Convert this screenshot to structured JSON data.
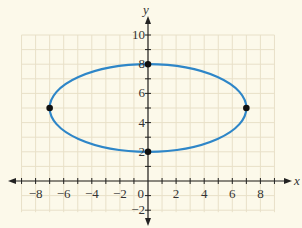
{
  "chart_data": {
    "type": "line",
    "title": "",
    "xlabel": "x",
    "ylabel": "y",
    "xlim": [
      -9,
      9
    ],
    "ylim": [
      -2.5,
      10.5
    ],
    "grid": true,
    "x_ticks": [
      -8,
      -6,
      -4,
      -2,
      0,
      2,
      4,
      6,
      8
    ],
    "x_tick_labels": [
      "−8",
      "−6",
      "−4",
      "−2",
      "0",
      "2",
      "4",
      "6",
      "8"
    ],
    "y_ticks": [
      -2,
      2,
      4,
      6,
      8,
      10
    ],
    "y_tick_labels": [
      "−2",
      "2",
      "4",
      "6",
      "8",
      "10"
    ],
    "series": [
      {
        "name": "ellipse",
        "shape": "ellipse",
        "center": [
          0,
          5
        ],
        "semi_axis_x": 7,
        "semi_axis_y": 3,
        "color": "#2e86c8"
      }
    ],
    "points": [
      {
        "x": -7,
        "y": 5
      },
      {
        "x": 7,
        "y": 5
      },
      {
        "x": 0,
        "y": 8
      },
      {
        "x": 0,
        "y": 2
      }
    ]
  },
  "colors": {
    "background": "#fcf9ea",
    "grid": "#e8e0c8",
    "axis": "#222222",
    "curve": "#2e86c8",
    "point": "#111111"
  }
}
